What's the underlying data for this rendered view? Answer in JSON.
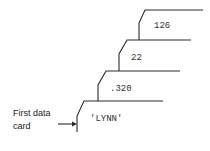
{
  "diagram": {
    "type": "stacked-data-cards",
    "cards": [
      {
        "order": 1,
        "value": "'LYNN'"
      },
      {
        "order": 2,
        "value": ".320"
      },
      {
        "order": 3,
        "value": "22"
      },
      {
        "order": 4,
        "value": "126"
      }
    ],
    "annotation": {
      "line1": "First data",
      "line2": "card",
      "points_to_card": 1
    },
    "colors": {
      "line": "#2a2a2a",
      "text": "#333333",
      "background": "#ffffff"
    }
  }
}
